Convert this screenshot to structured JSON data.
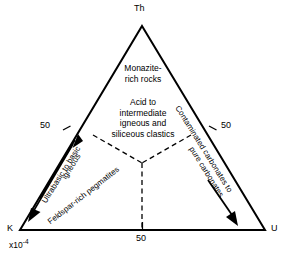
{
  "diagram": {
    "type": "ternary",
    "title": "",
    "vertices": [
      {
        "id": "th",
        "label": "Th",
        "position": "apex-top",
        "x": 142,
        "y": 26
      },
      {
        "id": "k",
        "label": "K",
        "position": "bottom-left",
        "x": 20,
        "y": 230
      },
      {
        "id": "u",
        "label": "U",
        "position": "bottom-right",
        "x": 265,
        "y": 230
      }
    ],
    "scale_note": {
      "text": "x10",
      "exponent": "-4",
      "applies_to": "K"
    },
    "ticks": [
      {
        "id": "tick-left",
        "value": "50",
        "edge": "K-Th"
      },
      {
        "id": "tick-right",
        "value": "50",
        "edge": "Th-U"
      },
      {
        "id": "tick-bottom",
        "value": "50",
        "edge": "K-U"
      }
    ],
    "fields": [
      {
        "id": "monazite",
        "lines": [
          "Monazite-",
          "rich rocks"
        ]
      },
      {
        "id": "acid-intermediate",
        "lines": [
          "Acid to",
          "intermediate",
          "igneous and",
          "siliceous clastics"
        ]
      }
    ],
    "edge_labels": [
      {
        "id": "ultrabasic",
        "lines": [
          "Ultrabasic to basic",
          "igneous"
        ],
        "edge": "K-Th",
        "direction": "toward-Th"
      },
      {
        "id": "feldspar",
        "lines": [
          "Feldspar-rich pegmatites"
        ],
        "edge": "interior-left"
      },
      {
        "id": "carbonates",
        "lines": [
          "Contaminated carbonates to",
          "pure carbonates"
        ],
        "edge": "Th-U",
        "direction": "toward-U"
      }
    ],
    "arrows": [
      {
        "id": "arrow-up-left-edge",
        "direction": "up-right",
        "edge": "K-Th"
      },
      {
        "id": "arrow-down-left-edge",
        "direction": "down-left",
        "edge": "K-Th"
      },
      {
        "id": "arrow-down-right-edge",
        "direction": "down-right",
        "edge": "Th-U"
      }
    ],
    "colors": {
      "line": "#000000",
      "background": "#ffffff",
      "dashed": "#000000"
    }
  }
}
